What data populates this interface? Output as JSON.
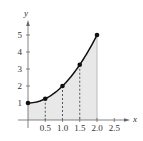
{
  "chart_data": {
    "type": "area",
    "title": "",
    "xlabel": "x",
    "ylabel": "y",
    "function_hint": "y = x^2 + 1",
    "x": [
      0,
      0.5,
      1.0,
      1.5,
      2.0
    ],
    "series": [
      {
        "name": "f(x)",
        "values": [
          1,
          1.25,
          2,
          3.25,
          5
        ]
      }
    ],
    "shaded_region": {
      "from": 0,
      "to": 2.0
    },
    "vertical_dashed_lines_at": [
      0.5,
      1.0,
      1.5
    ],
    "x_ticks": [
      "0.5",
      "1.0",
      "1.5",
      "2.0",
      "2.5"
    ],
    "y_ticks": [
      "1",
      "2",
      "3",
      "4",
      "5"
    ],
    "xlim": [
      0,
      2.6
    ],
    "ylim": [
      0,
      5.6
    ],
    "grid": false,
    "legend": null
  },
  "colors": {
    "curve": "#111111",
    "fill": "#e8e8e8",
    "axis": "#666666",
    "text": "#333333"
  }
}
